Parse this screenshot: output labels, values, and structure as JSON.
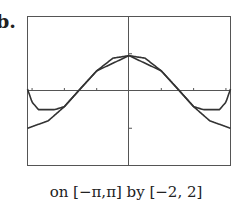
{
  "figure": {
    "label": "b.",
    "caption": "on [−π,π] by [−2, 2]"
  },
  "chart_data": {
    "type": "line",
    "title": "",
    "xlabel": "",
    "ylabel": "",
    "xlim": [
      -3.14159,
      3.14159
    ],
    "ylim": [
      -2,
      2
    ],
    "x_ticks": [
      -3,
      -2,
      -1,
      1,
      2,
      3
    ],
    "y_ticks": [
      -1,
      1
    ],
    "grid": false,
    "legend": null,
    "window_caption": "on [−π,π] by [−2, 2]",
    "series": [
      {
        "name": "curve 1 (lower at edges)",
        "description": "symmetric curve peaking near y≈1 at x=0, decreasing to about −1 at x=±π",
        "x": [
          -3.14,
          -2.5,
          -2,
          -1.5,
          -1,
          -0.5,
          0,
          0.5,
          1,
          1.5,
          2,
          2.5,
          3.14
        ],
        "values": [
          -1.0,
          -0.8,
          -0.42,
          0.07,
          0.54,
          0.88,
          0.95,
          0.88,
          0.54,
          0.07,
          -0.42,
          -0.8,
          -1.0
        ]
      },
      {
        "name": "curve 2 (upper at edges)",
        "description": "coincides with curve 1 over the middle, flattens near y≈−0.5 around x≈±2.6, then rises to about 0 at x=±π",
        "x": [
          -3.14,
          -3.0,
          -2.8,
          -2.6,
          -2.3,
          -2,
          -1,
          0,
          1,
          2,
          2.3,
          2.6,
          2.8,
          3.0,
          3.14
        ],
        "values": [
          0.05,
          -0.3,
          -0.5,
          -0.5,
          -0.5,
          -0.42,
          0.54,
          0.95,
          0.54,
          -0.42,
          -0.5,
          -0.5,
          -0.5,
          -0.3,
          0.05
        ]
      }
    ]
  }
}
